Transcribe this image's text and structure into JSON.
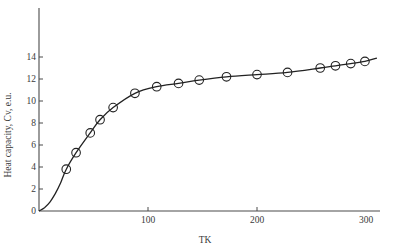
{
  "chart_data": {
    "type": "line",
    "title": "",
    "xlabel": "TK",
    "ylabel": "Heat capacity, Cv, e.u.",
    "xlim": [
      0,
      320
    ],
    "ylim": [
      0,
      18
    ],
    "grid": false,
    "legend": null,
    "x_ticks": [
      100,
      200,
      300
    ],
    "y_ticks": [
      0,
      2,
      4,
      6,
      8,
      10,
      12,
      14
    ],
    "series": [
      {
        "name": "Smooth curve",
        "style": "line",
        "x": [
          0,
          5,
          10,
          15,
          20,
          25,
          34,
          47,
          56,
          68,
          88,
          108,
          128,
          147,
          172,
          200,
          228,
          258,
          272,
          286,
          299,
          310
        ],
        "y": [
          0,
          0.3,
          0.8,
          1.6,
          2.6,
          3.8,
          5.3,
          7.1,
          8.3,
          9.4,
          10.7,
          11.3,
          11.6,
          11.9,
          12.2,
          12.4,
          12.6,
          13.0,
          13.2,
          13.4,
          13.6,
          13.9
        ]
      },
      {
        "name": "Measured points",
        "style": "open-circle",
        "x": [
          25,
          34,
          47,
          56,
          68,
          88,
          108,
          128,
          147,
          172,
          200,
          228,
          258,
          272,
          286,
          299
        ],
        "y": [
          3.8,
          5.3,
          7.1,
          8.3,
          9.4,
          10.7,
          11.3,
          11.6,
          11.9,
          12.2,
          12.4,
          12.6,
          13.0,
          13.2,
          13.4,
          13.6
        ]
      }
    ]
  },
  "colors": {
    "axis": "#4a4a4a",
    "line": "#222222",
    "marker": "#222222"
  }
}
